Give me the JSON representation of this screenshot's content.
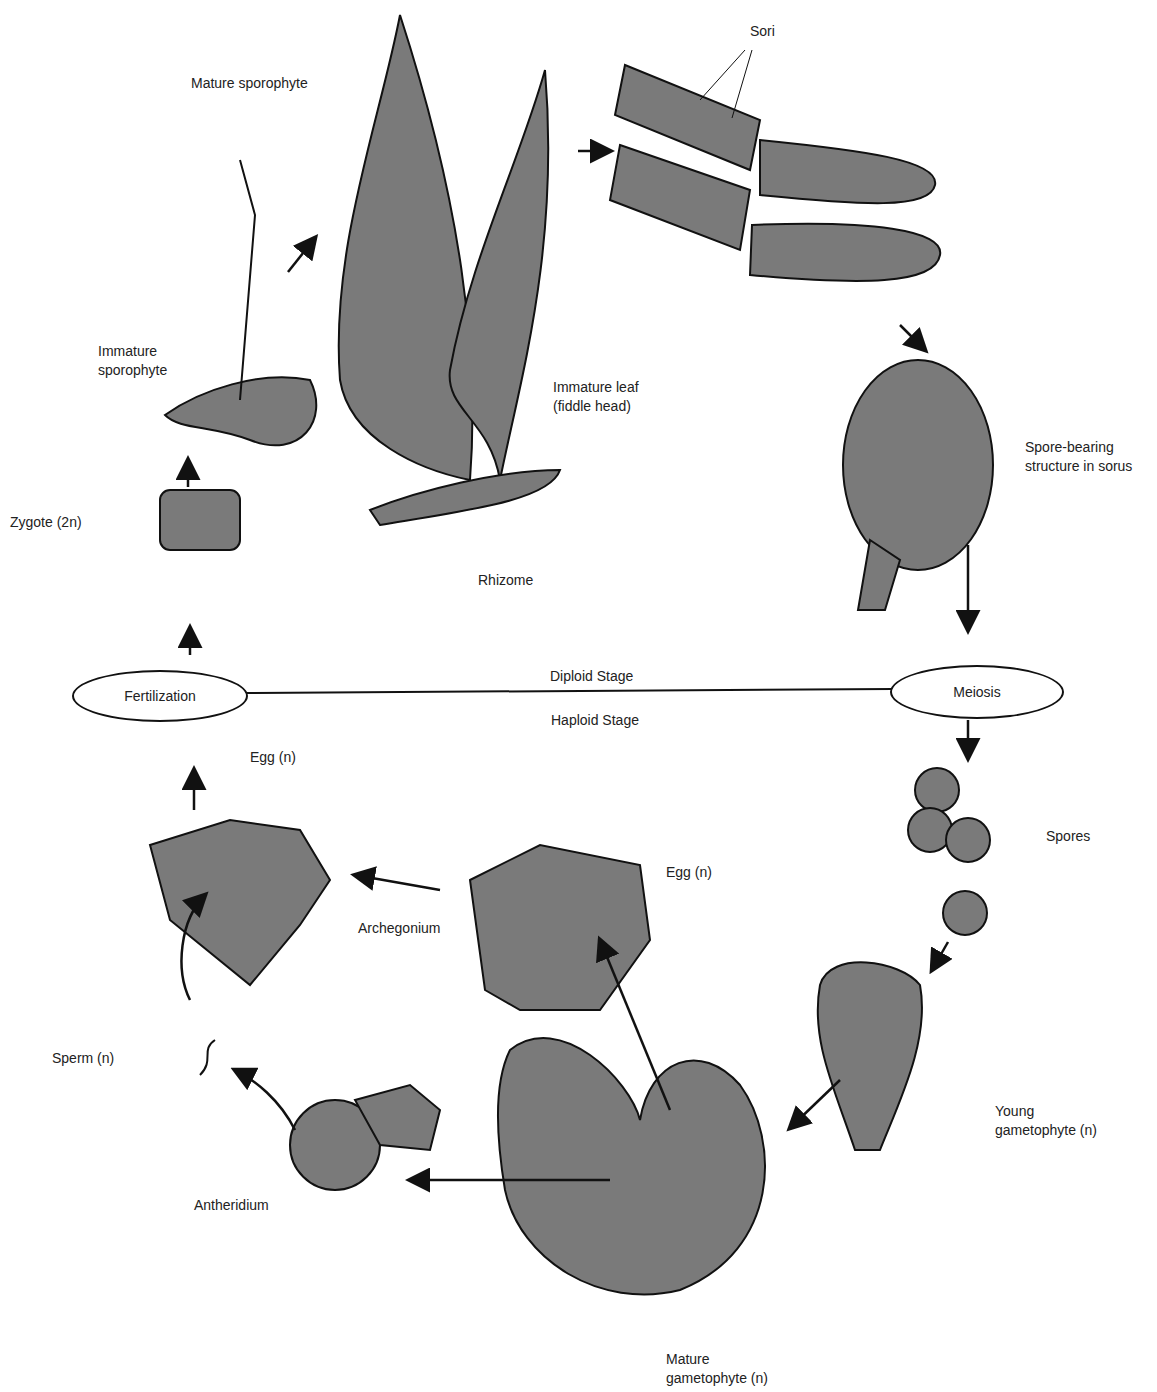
{
  "diagram": {
    "stages": {
      "diploid": "Diploid Stage",
      "haploid": "Haploid Stage"
    },
    "events": {
      "fertilization": "Fertilization",
      "meiosis": "Meiosis"
    },
    "labels": {
      "mature_sporophyte": "Mature sporophyte",
      "sori": "Sori",
      "immature_sporophyte_1": "Immature",
      "immature_sporophyte_2": "sporophyte",
      "immature_leaf_1": "Immature leaf",
      "immature_leaf_2": "(fiddle head)",
      "spore_bearing_1": "Spore-bearing",
      "spore_bearing_2": "structure in sorus",
      "rhizome": "Rhizome",
      "zygote": "Zygote (2n)",
      "egg_top": "Egg (n)",
      "egg_mid": "Egg (n)",
      "archegonium": "Archegonium",
      "spores": "Spores",
      "sperm": "Sperm (n)",
      "antheridium": "Antheridium",
      "young_gametophyte_1": "Young",
      "young_gametophyte_2": "gametophyte (n)",
      "mature_gametophyte_1": "Mature",
      "mature_gametophyte_2": "gametophyte (n)"
    },
    "colors": {
      "fill": "#7a7a7a",
      "line": "#111111"
    }
  }
}
